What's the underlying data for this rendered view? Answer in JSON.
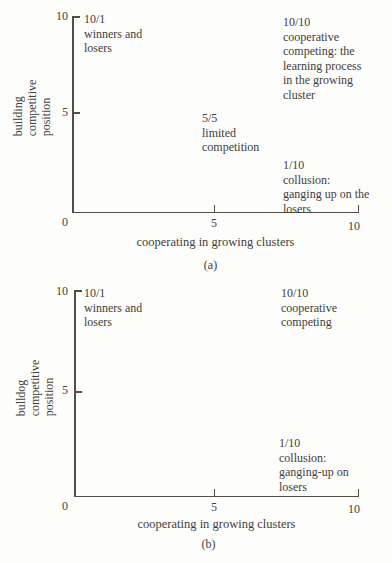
{
  "figure": {
    "background": "#fdfdfc",
    "text_color": "#413d39",
    "axis_color": "#514e4a"
  },
  "charts": [
    {
      "id": "a",
      "caption": "(a)",
      "xlabel": "cooperating in growing clusters",
      "ylabel_lines": [
        "building",
        "competitive",
        "position"
      ],
      "y_ticks": [
        "10",
        "5"
      ],
      "x_ticks": [
        "0",
        "5",
        "10"
      ],
      "annotations": [
        {
          "name": "winners-and-losers",
          "lines": [
            "10/1",
            "winners and",
            "losers"
          ]
        },
        {
          "name": "cooperative-competing",
          "lines": [
            "10/10",
            "cooperative",
            "competing: the",
            "learning process",
            "in the growing",
            "cluster"
          ]
        },
        {
          "name": "limited-competition",
          "lines": [
            "5/5",
            "limited",
            "competition"
          ]
        },
        {
          "name": "collusion",
          "lines": [
            "1/10",
            "collusion:",
            "ganging up on the",
            "losers"
          ]
        }
      ]
    },
    {
      "id": "b",
      "caption": "(b)",
      "xlabel": "cooperating in growing clusters",
      "ylabel_lines": [
        "bulldog",
        "competitive",
        "position"
      ],
      "y_ticks": [
        "10",
        "5"
      ],
      "x_ticks": [
        "0",
        "5",
        "10"
      ],
      "annotations": [
        {
          "name": "winners-and-losers",
          "lines": [
            "10/1",
            "winners and",
            "losers"
          ]
        },
        {
          "name": "cooperative-competing",
          "lines": [
            "10/10",
            "cooperative",
            "competing"
          ]
        },
        {
          "name": "collusion",
          "lines": [
            "1/10",
            "collusion:",
            "ganging-up on",
            "losers"
          ]
        }
      ]
    }
  ],
  "chart_data": [
    {
      "type": "scatter",
      "title": "",
      "xlabel": "cooperating in growing clusters",
      "ylabel": "building competitive position",
      "xlim": [
        0,
        10
      ],
      "ylim": [
        0,
        10
      ],
      "x_ticks": [
        0,
        5,
        10
      ],
      "y_ticks": [
        0,
        5,
        10
      ],
      "grid": false,
      "points": [
        {
          "x": 1,
          "y": 10,
          "score": "10/1",
          "label": "winners and losers"
        },
        {
          "x": 10,
          "y": 10,
          "score": "10/10",
          "label": "cooperative competing: the learning process in the growing cluster"
        },
        {
          "x": 5,
          "y": 5,
          "score": "5/5",
          "label": "limited competition"
        },
        {
          "x": 10,
          "y": 1,
          "score": "1/10",
          "label": "collusion: ganging up on the losers"
        }
      ]
    },
    {
      "type": "scatter",
      "title": "",
      "xlabel": "cooperating in growing clusters",
      "ylabel": "bulldog competitive position",
      "xlim": [
        0,
        10
      ],
      "ylim": [
        0,
        10
      ],
      "x_ticks": [
        0,
        5,
        10
      ],
      "y_ticks": [
        0,
        5,
        10
      ],
      "grid": false,
      "points": [
        {
          "x": 1,
          "y": 10,
          "score": "10/1",
          "label": "winners and losers"
        },
        {
          "x": 10,
          "y": 10,
          "score": "10/10",
          "label": "cooperative competing"
        },
        {
          "x": 10,
          "y": 1,
          "score": "1/10",
          "label": "collusion: ganging-up on losers"
        }
      ]
    }
  ]
}
